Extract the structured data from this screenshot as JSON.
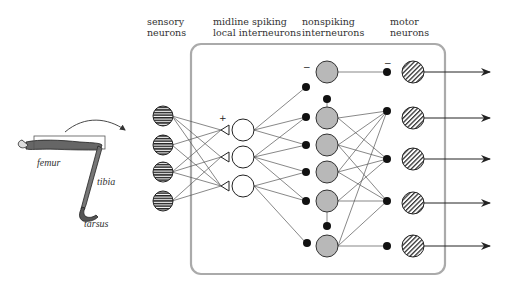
{
  "column_labels": {
    "sensory": [
      "sensory",
      "neurons"
    ],
    "midline": [
      "midline spiking",
      "local interneurons"
    ],
    "nonspiking": [
      "nonspiking",
      "interneurons"
    ],
    "motor": [
      "motor",
      "neurons"
    ]
  },
  "leg_labels": {
    "femur": "femur",
    "tibia": "tibia",
    "tarsus": "tarsus"
  },
  "signs": {
    "plus": "+",
    "minus_nonspiking": "−",
    "minus_motor": "−"
  },
  "colors": {
    "line": "#555555",
    "box": "#aaaaaa",
    "nonspiking_fill": "#b8b8b8",
    "dot": "#111111"
  },
  "layers": {
    "sensory_count": 4,
    "midline_count": 3,
    "nonspiking_count": 6,
    "motor_count": 5,
    "output_arrows": 5
  }
}
